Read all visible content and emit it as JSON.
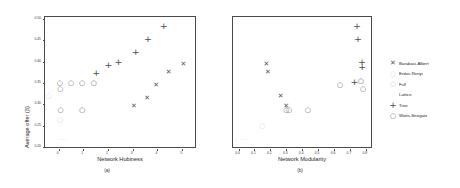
{
  "figure": {
    "ylabel": "Average offer (β)",
    "caption_a": "(a)",
    "caption_b": "(b)"
  },
  "legend": {
    "title": "",
    "items": [
      {
        "label": "Barabasi-Albert",
        "marker": "x-marker",
        "glyph": "✕",
        "color": "#555555"
      },
      {
        "label": "Erdos-Renyi",
        "marker": "circle-marker",
        "glyph": "○",
        "color": "#d9d9d9"
      },
      {
        "label": "Full",
        "marker": "circle-marker",
        "glyph": "○",
        "color": "#c8c8c8"
      },
      {
        "label": "Lattice",
        "marker": "dot-marker",
        "glyph": "·",
        "color": "#e8e8e8"
      },
      {
        "label": "Tree",
        "marker": "plus-marker",
        "glyph": "+",
        "color": "#4d4d4d"
      },
      {
        "label": "Watts-Strogatz",
        "marker": "circle-marker",
        "glyph": "○",
        "color": "#6b6b6b"
      }
    ]
  },
  "chart_data": [
    {
      "type": "scatter",
      "panel": "a",
      "title": "",
      "xlabel": "Network Hubiness",
      "ylabel": "Average offer (β)",
      "xlim": [
        -0.55,
        5.6
      ],
      "ylim": [
        0.195,
        0.505
      ],
      "xticks": [
        "0",
        "1",
        "2",
        "3",
        "4",
        "5"
      ],
      "xtick_values": [
        0,
        1,
        2,
        3,
        4,
        5
      ],
      "yticks": [
        "0.20",
        "0.25",
        "0.30",
        "0.35",
        "0.40",
        "0.45",
        "0.50"
      ],
      "ytick_values": [
        0.2,
        0.25,
        0.3,
        0.35,
        0.4,
        0.45,
        0.5
      ],
      "grid": false,
      "legend_position": "outside-right",
      "series": [
        {
          "name": "Barabasi-Albert",
          "marker": "x-marker",
          "glyph": "✕",
          "color": "#555555",
          "points": [
            [
              3.05,
              0.295
            ],
            [
              3.58,
              0.315
            ],
            [
              3.95,
              0.345
            ],
            [
              4.45,
              0.375
            ],
            [
              5.05,
              0.395
            ]
          ]
        },
        {
          "name": "Tree",
          "marker": "plus-marker",
          "glyph": "+",
          "color": "#4d4d4d",
          "points": [
            [
              1.52,
              0.375
            ],
            [
              2.02,
              0.395
            ],
            [
              2.42,
              0.4
            ],
            [
              3.12,
              0.425
            ],
            [
              3.62,
              0.455
            ],
            [
              4.25,
              0.485
            ]
          ]
        },
        {
          "name": "Watts-Strogatz",
          "marker": "circle-marker",
          "glyph": "○",
          "color": "#6b6b6b",
          "points": [
            [
              0.05,
              0.35
            ],
            [
              0.07,
              0.335
            ],
            [
              0.5,
              0.35
            ],
            [
              0.95,
              0.35
            ],
            [
              1.42,
              0.35
            ],
            [
              0.08,
              0.285
            ],
            [
              0.95,
              0.285
            ]
          ]
        },
        {
          "name": "Full",
          "marker": "circle-marker",
          "glyph": "○",
          "color": "#c8c8c8",
          "points": [
            [
              1.42,
              0.35
            ],
            [
              0.97,
              0.285
            ]
          ]
        },
        {
          "name": "Erdos-Renyi",
          "marker": "circle-marker",
          "glyph": "○",
          "color": "#d9d9d9",
          "points": [
            [
              -0.42,
              0.32
            ],
            [
              0.06,
              0.262
            ]
          ]
        },
        {
          "name": "Lattice",
          "marker": "dot-marker",
          "glyph": "·",
          "color": "#e2e2e2",
          "points": [
            [
              0.1,
              0.248
            ],
            [
              0.05,
              0.215
            ],
            [
              0.18,
              0.215
            ],
            [
              0.3,
              0.215
            ]
          ]
        }
      ]
    },
    {
      "type": "scatter",
      "panel": "b",
      "title": "",
      "xlabel": "Network Modularity",
      "ylabel": "Average offer (β)",
      "xlim": [
        -0.035,
        0.845
      ],
      "ylim": [
        0.195,
        0.505
      ],
      "xticks": [
        "0.0",
        "0.1",
        "0.2",
        "0.3",
        "0.4",
        "0.5",
        "0.6",
        "0.7",
        "0.8"
      ],
      "xtick_values": [
        0.0,
        0.1,
        0.2,
        0.3,
        0.4,
        0.5,
        0.6,
        0.7,
        0.8
      ],
      "yticks": [],
      "grid": false,
      "legend_position": "outside-right",
      "series": [
        {
          "name": "Barabasi-Albert",
          "marker": "x-marker",
          "glyph": "✕",
          "color": "#555555",
          "points": [
            [
              0.175,
              0.395
            ],
            [
              0.185,
              0.375
            ],
            [
              0.265,
              0.32
            ],
            [
              0.3,
              0.295
            ]
          ]
        },
        {
          "name": "Tree",
          "marker": "plus-marker",
          "glyph": "+",
          "color": "#4d4d4d",
          "points": [
            [
              0.745,
              0.485
            ],
            [
              0.75,
              0.455
            ],
            [
              0.775,
              0.4
            ],
            [
              0.778,
              0.39
            ],
            [
              0.728,
              0.355
            ]
          ]
        },
        {
          "name": "Watts-Strogatz",
          "marker": "circle-marker",
          "glyph": "○",
          "color": "#6b6b6b",
          "points": [
            [
              0.3,
              0.285
            ],
            [
              0.318,
              0.285
            ],
            [
              0.435,
              0.285
            ],
            [
              0.638,
              0.345
            ],
            [
              0.77,
              0.355
            ],
            [
              0.782,
              0.335
            ]
          ]
        },
        {
          "name": "Full",
          "marker": "circle-marker",
          "glyph": "○",
          "color": "#c8c8c8",
          "points": [
            [
              0.762,
              0.355
            ]
          ]
        },
        {
          "name": "Erdos-Renyi",
          "marker": "circle-marker",
          "glyph": "○",
          "color": "#d9d9d9",
          "points": [
            [
              0.15,
              0.248
            ]
          ]
        },
        {
          "name": "Lattice",
          "marker": "dot-marker",
          "glyph": "·",
          "color": "#e2e2e2",
          "points": [
            [
              -0.015,
              0.215
            ],
            [
              0.02,
              0.215
            ],
            [
              0.048,
              0.215
            ],
            [
              0.075,
              0.215
            ]
          ]
        }
      ]
    }
  ]
}
